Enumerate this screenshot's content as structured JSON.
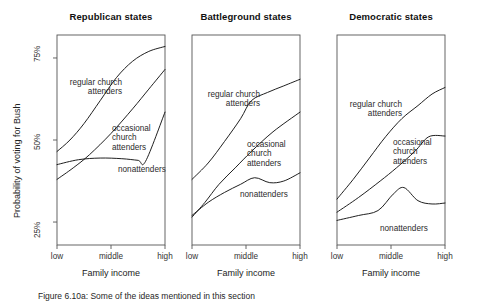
{
  "figure": {
    "ylabel": "Probability of voting for Bush",
    "xlabel": "Family income",
    "yticks": [
      "75%",
      "50%",
      "25%"
    ],
    "xticks": [
      "low",
      "middle",
      "high"
    ],
    "caption": "Figure 6.10a: Some of the ideas mentioned in this section",
    "line_color": "#141414",
    "frame_color": "#555555"
  },
  "chart_data": {
    "type": "line",
    "xlabel": "Family income",
    "ylabel": "Probability of voting for Bush",
    "x": [
      "low",
      "middle",
      "high"
    ],
    "xlim": [
      0,
      1
    ],
    "ylim": [
      18,
      82
    ],
    "yticks": [
      25,
      50,
      75
    ],
    "ytick_labels": [
      "25%",
      "50%",
      "75%"
    ],
    "grid": false,
    "legend": "inline-annotations",
    "panels": [
      {
        "title": "Republican states",
        "series": [
          {
            "name": "regular church attenders",
            "label": "regular church\nattenders",
            "x": [
              0.0,
              0.12,
              0.25,
              0.4,
              0.55,
              0.7,
              0.85,
              1.0
            ],
            "values": [
              46.5,
              50.0,
              55.0,
              62.0,
              69.0,
              74.0,
              77.0,
              78.5
            ]
          },
          {
            "name": "occasional church attenders",
            "label": "occasional\nchurch\nattenders",
            "x": [
              0.0,
              0.15,
              0.3,
              0.5,
              0.7,
              0.85,
              1.0
            ],
            "values": [
              38.0,
              41.5,
              45.5,
              52.0,
              59.5,
              65.5,
              71.5
            ]
          },
          {
            "name": "nonattenders",
            "label": "nonattenders",
            "x": [
              0.0,
              0.2,
              0.4,
              0.6,
              0.75,
              0.82,
              1.0
            ],
            "values": [
              42.5,
              44.0,
              44.5,
              44.3,
              43.8,
              43.5,
              58.5
            ]
          }
        ]
      },
      {
        "title": "Battleground states",
        "series": [
          {
            "name": "regular church attenders",
            "label": "regular church\nattenders",
            "x": [
              0.0,
              0.15,
              0.3,
              0.45,
              0.55,
              0.7,
              0.85,
              1.0
            ],
            "values": [
              38.0,
              43.0,
              49.5,
              56.5,
              62.0,
              64.5,
              66.5,
              68.5
            ]
          },
          {
            "name": "occasional church attenders",
            "label": "occasional\nchurch\nattenders",
            "x": [
              0.0,
              0.12,
              0.25,
              0.4,
              0.55,
              0.75,
              1.0
            ],
            "values": [
              26.5,
              31.0,
              36.5,
              41.5,
              46.5,
              52.5,
              58.5
            ]
          },
          {
            "name": "nonattenders",
            "label": "nonattenders",
            "x": [
              0.0,
              0.15,
              0.3,
              0.45,
              0.58,
              0.72,
              0.85,
              1.0
            ],
            "values": [
              27.0,
              31.0,
              34.0,
              36.5,
              38.5,
              37.0,
              37.5,
              40.0
            ]
          }
        ]
      },
      {
        "title": "Democratic states",
        "series": [
          {
            "name": "regular church attenders",
            "label": "regular church\nattenders",
            "x": [
              0.0,
              0.15,
              0.3,
              0.45,
              0.6,
              0.75,
              0.88,
              1.0
            ],
            "values": [
              32.0,
              38.0,
              44.5,
              51.0,
              56.5,
              60.5,
              64.0,
              66.0
            ]
          },
          {
            "name": "occasional church attenders",
            "label": "occasional\nchurch\nattenders",
            "x": [
              0.0,
              0.2,
              0.4,
              0.55,
              0.72,
              0.85,
              1.0
            ],
            "values": [
              28.0,
              32.5,
              37.5,
              41.5,
              46.5,
              51.0,
              51.2
            ]
          },
          {
            "name": "nonattenders",
            "label": "nonattenders",
            "x": [
              0.0,
              0.2,
              0.38,
              0.52,
              0.62,
              0.75,
              0.88,
              1.0
            ],
            "values": [
              25.5,
              27.0,
              28.5,
              33.5,
              35.5,
              31.5,
              30.5,
              30.8
            ]
          }
        ]
      }
    ]
  },
  "annotations": {
    "panel1": {
      "regular": "regular church\nattenders",
      "occasional": "occasional\nchurch\nattenders",
      "nonattenders": "nonattenders"
    },
    "panel2": {
      "regular": "regular church\nattenders",
      "occasional": "occasional\nchurch\nattenders",
      "nonattenders": "nonattenders"
    },
    "panel3": {
      "regular": "regular church\nattenders",
      "occasional": "occasional\nchurch\nattenders",
      "nonattenders": "nonattenders"
    }
  }
}
